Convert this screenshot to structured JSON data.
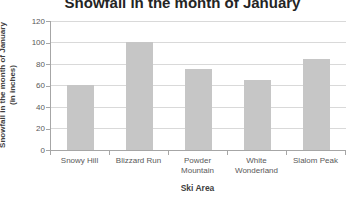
{
  "chart_data": {
    "type": "bar",
    "title": "Snowfall in the month of January",
    "categories": [
      "Snowy Hill",
      "Blizzard Run",
      "Powder Mountain",
      "White Wonderland",
      "Slalom Peak"
    ],
    "values": [
      60,
      100,
      75,
      65,
      85
    ],
    "xlabel": "Ski Area",
    "ylabel_line1": "Snowfall in the month of January",
    "ylabel_line2": "(in inches)",
    "ylim": [
      0,
      120
    ],
    "ytick_step": 20,
    "yticks": [
      0,
      20,
      40,
      60,
      80,
      100,
      120
    ],
    "grid": true,
    "legend": "none",
    "bar_color": "#c6c6c6",
    "gridline_color": "#d9d9d9",
    "axis_color": "#a6a6a6",
    "tick_label_color": "#595959",
    "axis_title_color": "#3f3f3f",
    "title_color": "#242424"
  }
}
